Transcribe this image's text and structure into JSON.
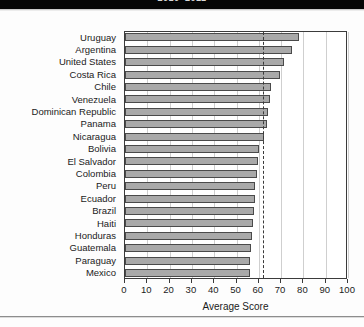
{
  "header": {
    "caption": "2010–2011"
  },
  "chart_data": {
    "type": "bar",
    "orientation": "horizontal",
    "title": "",
    "subtitle": "",
    "xlabel": "Average Score",
    "ylabel": "",
    "xlim": [
      0,
      100
    ],
    "xticks": [
      0,
      10,
      20,
      30,
      40,
      50,
      60,
      70,
      80,
      90,
      100
    ],
    "xtick_labels": [
      "0",
      "10",
      "20",
      "30",
      "40",
      "50",
      "60",
      "70",
      "80",
      "90",
      "100"
    ],
    "grid": true,
    "grid_axis": "x",
    "legend": null,
    "bar_color": "#a9a9a9",
    "bar_edge_color": "#4a4a4a",
    "reference_line": {
      "value": 62,
      "style": "dashed",
      "color": "#3a3a3a"
    },
    "categories": [
      "Uruguay",
      "Argentina",
      "United States",
      "Costa Rica",
      "Chile",
      "Venezuela",
      "Dominican Republic",
      "Panama",
      "Nicaragua",
      "Bolivia",
      "El Salvador",
      "Colombia",
      "Peru",
      "Ecuador",
      "Brazil",
      "Haiti",
      "Honduras",
      "Guatemala",
      "Paraguay",
      "Mexico"
    ],
    "values": [
      78,
      75,
      71.5,
      69.5,
      65.5,
      65,
      64,
      63.5,
      62.5,
      60,
      59.5,
      59,
      58.5,
      58.5,
      58,
      57.5,
      57,
      56.5,
      56,
      56
    ]
  }
}
